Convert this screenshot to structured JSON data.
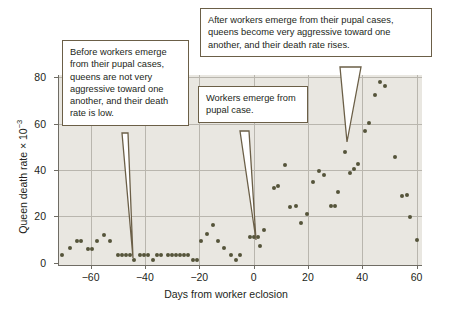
{
  "figure": {
    "background_color": "#ffffff",
    "plot_background_color": "#e9e7e1",
    "grid_color": "#b9b6ae",
    "point_color": "#55543a",
    "callout_border_color": "#6b5f47"
  },
  "axes": {
    "x_title": "Days from worker eclosion",
    "y_title_main": "Queen death rate × 10",
    "y_title_exponent": "−3",
    "x_ticks": [
      "−60",
      "−40",
      "−20",
      "0",
      "20",
      "40",
      "60"
    ],
    "x_tick_values": [
      -60,
      -40,
      -20,
      0,
      20,
      40,
      60
    ],
    "y_ticks": [
      "0",
      "20",
      "40",
      "60",
      "80"
    ],
    "y_tick_values": [
      0,
      20,
      40,
      60,
      80
    ]
  },
  "callouts": [
    {
      "name": "callout-before-emergence",
      "text": "Before workers emerge from their pupal cases, queens are not very aggressive toward one another, and their death rate is low.",
      "points_to_x": -47,
      "points_to_y": 3
    },
    {
      "name": "callout-workers-emerge",
      "text": "Workers emerge from pupal case.",
      "points_to_x": 0,
      "points_to_y": 11
    },
    {
      "name": "callout-after-emergence",
      "text": "After workers emerge from their pupal cases, queens become very aggressive toward one another, and their death rate rises.",
      "points_to_x": 33,
      "points_to_y": 52
    }
  ],
  "chart_data": {
    "type": "scatter",
    "title": "",
    "xlabel": "Days from worker eclosion",
    "ylabel": "Queen death rate × 10^-3",
    "xlim": [
      -72,
      62
    ],
    "ylim": [
      -1,
      81
    ],
    "grid": true,
    "legend": "none",
    "series": [
      {
        "name": "Queen death rate",
        "color": "#55543a",
        "points": [
          [
            -70.5,
            3.4
          ],
          [
            -67.5,
            6.3
          ],
          [
            -65.0,
            9.2
          ],
          [
            -63.5,
            9.2
          ],
          [
            -61.0,
            6.0
          ],
          [
            -59.5,
            6.0
          ],
          [
            -57.5,
            9.3
          ],
          [
            -55.0,
            12.0
          ],
          [
            -53.0,
            9.3
          ],
          [
            -50.0,
            3.5
          ],
          [
            -48.5,
            3.5
          ],
          [
            -47.0,
            3.5
          ],
          [
            -45.5,
            3.5
          ],
          [
            -44.0,
            1.2
          ],
          [
            -42.0,
            3.5
          ],
          [
            -40.5,
            3.5
          ],
          [
            -39.0,
            3.5
          ],
          [
            -37.0,
            1.2
          ],
          [
            -35.5,
            3.5
          ],
          [
            -34.0,
            3.5
          ],
          [
            -31.5,
            3.5
          ],
          [
            -30.0,
            3.5
          ],
          [
            -28.5,
            3.5
          ],
          [
            -27.0,
            3.5
          ],
          [
            -25.5,
            3.5
          ],
          [
            -24.0,
            3.5
          ],
          [
            -22.5,
            1.2
          ],
          [
            -21.0,
            1.2
          ],
          [
            -19.5,
            9.2
          ],
          [
            -17.0,
            12.2
          ],
          [
            -15.0,
            16.2
          ],
          [
            -13.0,
            9.3
          ],
          [
            -11.0,
            6.2
          ],
          [
            -8.5,
            3.4
          ],
          [
            -6.5,
            1.3
          ],
          [
            -5.0,
            3.5
          ],
          [
            -1.5,
            11.0
          ],
          [
            0.0,
            11.0
          ],
          [
            1.5,
            11.0
          ],
          [
            2.5,
            7.2
          ],
          [
            4.0,
            14.0
          ],
          [
            7.5,
            32.2
          ],
          [
            9.0,
            33.0
          ],
          [
            11.5,
            42.0
          ],
          [
            13.5,
            24.2
          ],
          [
            15.5,
            24.6
          ],
          [
            17.5,
            17.2
          ],
          [
            19.5,
            21.0
          ],
          [
            22.0,
            34.8
          ],
          [
            24.0,
            39.6
          ],
          [
            26.0,
            37.8
          ],
          [
            28.5,
            24.5
          ],
          [
            30.0,
            24.6
          ],
          [
            31.0,
            30.6
          ],
          [
            33.5,
            47.8
          ],
          [
            35.5,
            38.8
          ],
          [
            37.0,
            40.5
          ],
          [
            38.5,
            42.4
          ],
          [
            41.0,
            56.8
          ],
          [
            42.5,
            60.2
          ],
          [
            44.5,
            72.5
          ],
          [
            46.5,
            78.0
          ],
          [
            48.5,
            76.2
          ],
          [
            52.0,
            45.5
          ],
          [
            54.5,
            28.6
          ],
          [
            56.5,
            29.3
          ],
          [
            57.5,
            19.8
          ],
          [
            60.0,
            9.8
          ]
        ]
      }
    ]
  }
}
